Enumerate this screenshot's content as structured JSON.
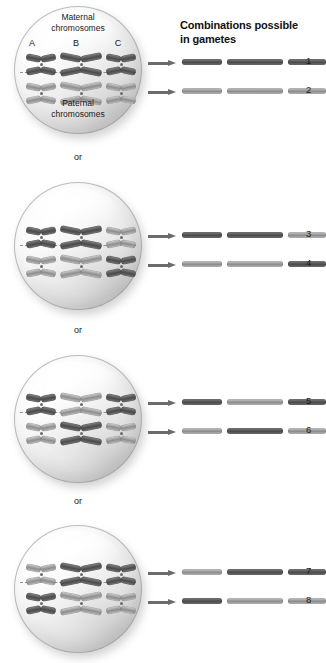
{
  "figure": {
    "title_line1": "Combinations possible",
    "title_line2": "in gametes",
    "separator_label": "or",
    "maternal_label_line1": "Maternal",
    "maternal_label_line2": "chromosomes",
    "paternal_label_line1": "Paternal",
    "paternal_label_line2": "chromosomes",
    "chromosome_letters": [
      "A",
      "B",
      "C"
    ]
  },
  "chart_data": {
    "type": "diagram",
    "title": "Combinations possible in gametes",
    "chromosome_pairs": [
      "A",
      "B",
      "C"
    ],
    "origins": [
      "maternal",
      "paternal"
    ],
    "cells": [
      {
        "index": 1,
        "labels_shown": true,
        "top_row_origins": [
          "maternal",
          "maternal",
          "maternal"
        ],
        "bottom_row_origins": [
          "paternal",
          "paternal",
          "paternal"
        ],
        "gametes": [
          {
            "number": "1",
            "segments": [
              "maternal",
              "maternal",
              "maternal"
            ]
          },
          {
            "number": "2",
            "segments": [
              "paternal",
              "paternal",
              "paternal"
            ]
          }
        ]
      },
      {
        "index": 2,
        "labels_shown": false,
        "top_row_origins": [
          "maternal",
          "maternal",
          "paternal"
        ],
        "bottom_row_origins": [
          "paternal",
          "paternal",
          "maternal"
        ],
        "gametes": [
          {
            "number": "3",
            "segments": [
              "maternal",
              "maternal",
              "paternal"
            ]
          },
          {
            "number": "4",
            "segments": [
              "paternal",
              "paternal",
              "maternal"
            ]
          }
        ]
      },
      {
        "index": 3,
        "labels_shown": false,
        "top_row_origins": [
          "maternal",
          "paternal",
          "maternal"
        ],
        "bottom_row_origins": [
          "paternal",
          "maternal",
          "paternal"
        ],
        "gametes": [
          {
            "number": "5",
            "segments": [
              "maternal",
              "paternal",
              "maternal"
            ]
          },
          {
            "number": "6",
            "segments": [
              "paternal",
              "maternal",
              "paternal"
            ]
          }
        ]
      },
      {
        "index": 4,
        "labels_shown": false,
        "top_row_origins": [
          "paternal",
          "maternal",
          "maternal"
        ],
        "bottom_row_origins": [
          "maternal",
          "paternal",
          "paternal"
        ],
        "gametes": [
          {
            "number": "7",
            "segments": [
              "paternal",
              "maternal",
              "maternal"
            ]
          },
          {
            "number": "8",
            "segments": [
              "maternal",
              "paternal",
              "paternal"
            ]
          }
        ]
      }
    ],
    "gamete_numbers": [
      "1",
      "2",
      "3",
      "4",
      "5",
      "6",
      "7",
      "8"
    ],
    "total_combinations": 8,
    "colors": {
      "dark_chromatid": "#4b4b4b",
      "light_chromatid": "#8e8e8e",
      "arrow": "#6b6b6b",
      "cell_outline": "#8c8c8c",
      "text": "#1a1a1a"
    }
  }
}
